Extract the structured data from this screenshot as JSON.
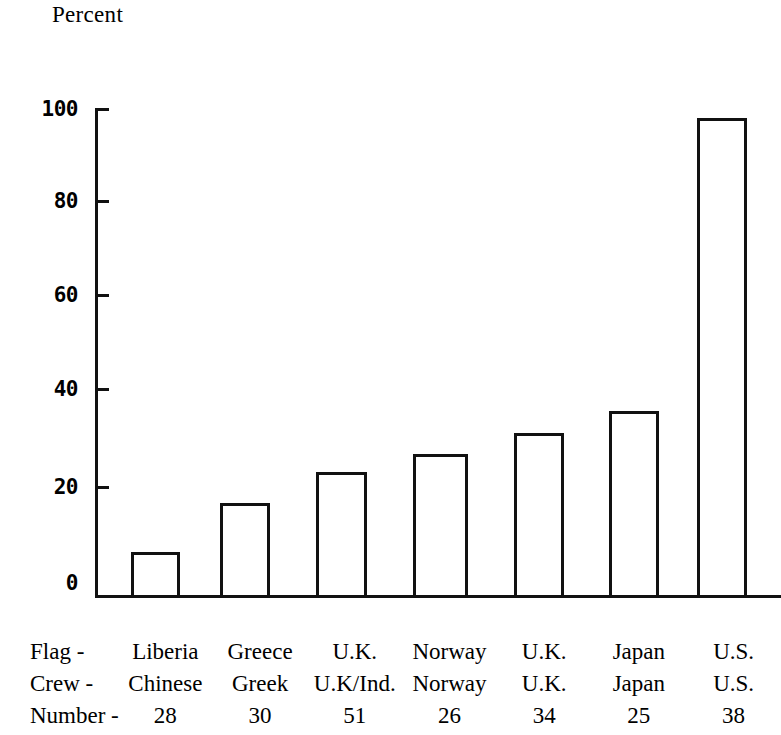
{
  "chart_data": {
    "type": "bar",
    "title": "Percent",
    "xlabel": "",
    "ylabel": "Percent",
    "ylim": [
      0,
      100
    ],
    "yticks": [
      0,
      20,
      40,
      60,
      80,
      100
    ],
    "grid": false,
    "legend": "none",
    "categories": [
      "Liberia",
      "Greece",
      "U.K.",
      "Norway",
      "U.K.",
      "Japan",
      "U.S."
    ],
    "values": [
      9,
      19,
      25.5,
      29,
      33.5,
      38,
      98
    ],
    "series": [
      {
        "name": "Percent",
        "values": [
          9,
          19,
          25.5,
          29,
          33.5,
          38,
          98
        ]
      }
    ],
    "row_labels": [
      "Flag -",
      "Crew -",
      "Number -"
    ],
    "rows": {
      "flag": [
        "Liberia",
        "Greece",
        "U.K.",
        "Norway",
        "U.K.",
        "Japan",
        "U.S."
      ],
      "crew": [
        "Chinese",
        "Greek",
        "U.K/Ind.",
        "Norway",
        "U.K.",
        "Japan",
        "U.S."
      ],
      "number": [
        "28",
        "30",
        "51",
        "26",
        "34",
        "25",
        "38"
      ]
    },
    "bar_style": {
      "fill": "none",
      "stroke": "#111111",
      "stroke_width": 3
    }
  },
  "axis": {
    "tick_labels": {
      "t100": "100",
      "t80": "80",
      "t60": "60",
      "t40": "40",
      "t20": "20",
      "t0": "0"
    }
  },
  "labels": {
    "row_flag": "Flag -",
    "row_crew": "Crew -",
    "row_number": "Number -",
    "flag_0": "Liberia",
    "flag_1": "Greece",
    "flag_2": "U.K.",
    "flag_3": "Norway",
    "flag_4": "U.K.",
    "flag_5": "Japan",
    "flag_6": "U.S.",
    "crew_0": "Chinese",
    "crew_1": "Greek",
    "crew_2": "U.K/Ind.",
    "crew_3": "Norway",
    "crew_4": "U.K.",
    "crew_5": "Japan",
    "crew_6": "U.S.",
    "number_0": "28",
    "number_1": "30",
    "number_2": "51",
    "number_3": "26",
    "number_4": "34",
    "number_5": "25",
    "number_6": "38"
  }
}
